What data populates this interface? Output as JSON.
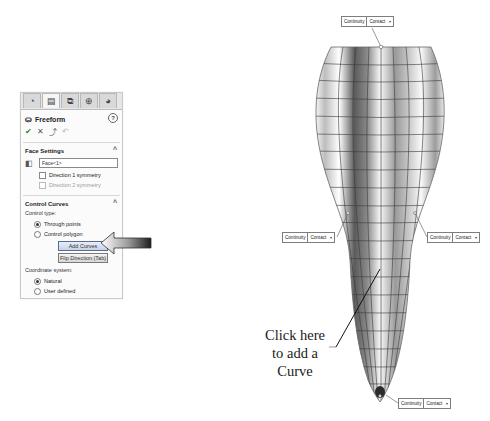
{
  "panel": {
    "tabs": [
      {
        "name": "feature-manager",
        "glyph": "◔",
        "active": false
      },
      {
        "name": "property-manager",
        "glyph": "▤",
        "active": true
      },
      {
        "name": "configuration-manager",
        "glyph": "⧉",
        "active": false
      },
      {
        "name": "dimxpert-manager",
        "glyph": "⊕",
        "active": false
      },
      {
        "name": "display-manager",
        "glyph": "◕",
        "active": false
      }
    ],
    "title": "Freeform",
    "help_glyph": "?",
    "actions": {
      "ok": "✔",
      "cancel": "✕",
      "pushpin": "⤴",
      "undo": "↶"
    },
    "face_settings": {
      "title": "Face Settings",
      "collapse": "^",
      "face_value": "Face<1>",
      "direction1": "Direction 1 symmetry",
      "direction2": "Direction 2 symmetry"
    },
    "control_curves": {
      "title": "Control Curves",
      "collapse": "^",
      "control_type_label": "Control type:",
      "through_points": "Through points",
      "control_polygon": "Control polygon",
      "add_curves": "Add Curves",
      "flip_direction": "Flip Direction (Tab)",
      "coord_label": "Coordinate system:",
      "natural": "Natural",
      "user_defined": "User defined"
    }
  },
  "callouts": [
    {
      "id": "top",
      "label": "Continuity",
      "value": "Contact",
      "dropdown": "▾"
    },
    {
      "id": "left",
      "label": "Continuity",
      "value": "Contact",
      "dropdown": "▾"
    },
    {
      "id": "right",
      "label": "Continuity",
      "value": "Contact",
      "dropdown": "▾"
    },
    {
      "id": "bottom",
      "label": "Continuity",
      "value": "Contact",
      "dropdown": "▾"
    }
  ],
  "annotation": {
    "line1": "Click here",
    "line2": "to add a",
    "line3": "Curve"
  },
  "colors": {
    "highlight_button": "#c6d2e6",
    "ok_check": "#3a7d2c",
    "panel_border": "#c9c9c9"
  }
}
